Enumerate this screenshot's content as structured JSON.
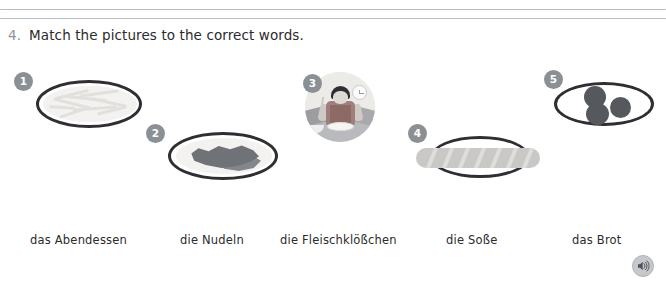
{
  "exercise": {
    "number": "4.",
    "instruction": "Match the pictures to the correct words."
  },
  "pictures": [
    {
      "badge": "1",
      "name": "picture-pasta-strands",
      "alt": "plate of pasta strands"
    },
    {
      "badge": "2",
      "name": "picture-noodles-pile",
      "alt": "plate with pile of noodles"
    },
    {
      "badge": "3",
      "name": "picture-child-eating-dinner",
      "alt": "photo of a child eating dinner at a table"
    },
    {
      "badge": "4",
      "name": "picture-baguette-bread",
      "alt": "plate with baguette bread"
    },
    {
      "badge": "5",
      "name": "picture-meatballs",
      "alt": "plate with three meatballs"
    }
  ],
  "words": [
    {
      "label": "das Abendessen"
    },
    {
      "label": "die Nudeln"
    },
    {
      "label": "die Fleischklößchen"
    },
    {
      "label": "die Soße"
    },
    {
      "label": "das Brot"
    }
  ],
  "controls": {
    "audio_icon": "speaker-icon",
    "prev_panel_icon": "circle-icon"
  },
  "colors": {
    "badge": "#8b9095",
    "plate_outline": "#2f2f33",
    "panel_border": "#b9bcc0",
    "text": "#2b2b2b",
    "question_number": "#8f9499"
  }
}
